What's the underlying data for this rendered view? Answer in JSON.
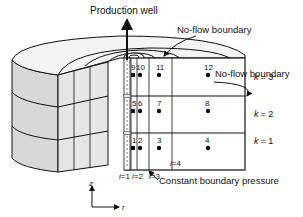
{
  "title": "Production well",
  "labels": {
    "no_flow_top": "No-flow boundary",
    "no_flow_side": "No-flow boundary",
    "constant_pressure": "Constant boundary pressure"
  },
  "layers": [
    {
      "name": "k",
      "eq": "= 3"
    },
    {
      "name": "k",
      "eq": "= 2"
    },
    {
      "name": "k",
      "eq": "= 1"
    }
  ],
  "columns": [
    {
      "name": "i",
      "eq": "=1"
    },
    {
      "name": "i",
      "eq": "=2"
    },
    {
      "name": "i",
      "eq": "=3"
    },
    {
      "name": "i",
      "eq": "=4"
    }
  ],
  "cells": {
    "row_k3": [
      "9",
      "10",
      "11",
      "12"
    ],
    "row_k2": [
      "5",
      "6",
      "7",
      "8"
    ],
    "row_k1": [
      "1",
      "2",
      "3",
      "4"
    ]
  },
  "axes": {
    "z": "z",
    "r": "r"
  },
  "colors": {
    "stroke": "#111111",
    "shade": "#d8d8d8",
    "face": "#ffffff"
  }
}
